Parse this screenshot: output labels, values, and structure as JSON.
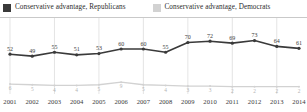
{
  "legend": {
    "items": [
      {
        "label": "Conservative advantage, Republicans",
        "color": "#3a3a3a",
        "icon": "legend-swatch-dark"
      },
      {
        "label": "Conservative advantage, Democrats",
        "color": "#d2d2d2",
        "icon": "legend-swatch-light"
      }
    ]
  },
  "chart_data": {
    "type": "line",
    "title": "",
    "subtitle": "",
    "xlabel": "",
    "ylabel": "",
    "categories": [
      "2001",
      "2002",
      "2003",
      "2004",
      "2005",
      "2006",
      "2007",
      "2008",
      "2009",
      "2010",
      "2011",
      "2012",
      "2013",
      "2014"
    ],
    "tick_labels": [
      "2001",
      "2002",
      "2003",
      "2004",
      "2005",
      "2006",
      "2007",
      "2008",
      "2009",
      "2010",
      "2011",
      "2012",
      "2013",
      "2014"
    ],
    "ylim": [
      0,
      80
    ],
    "grid": "vertical",
    "legend_position": "top-left",
    "series": [
      {
        "name": "Conservative advantage, Republicans",
        "color": "#3a3a3a",
        "labels_shown": true,
        "values": [
          52,
          49,
          55,
          51,
          53,
          60,
          60,
          55,
          70,
          72,
          69,
          73,
          64,
          61
        ]
      },
      {
        "name": "Conservative advantage, Democrats",
        "color": "#d2d2d2",
        "labels_shown": true,
        "values": [
          6,
          5,
          4,
          4,
          5,
          9,
          5,
          4,
          3,
          3,
          2,
          2,
          2,
          2
        ]
      }
    ]
  },
  "colors": {
    "republican_line": "#3a3a3a",
    "democrat_line": "#d2d2d2",
    "gridline": "#d8d8d8",
    "rule": "#c9c9c9",
    "text": "#2b2b2b"
  }
}
